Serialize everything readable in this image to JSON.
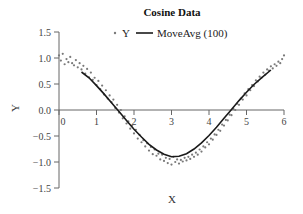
{
  "chart_data": {
    "type": "scatter",
    "title": "Cosine Data",
    "xlabel": "X",
    "ylabel": "Y",
    "xlim": [
      0,
      6
    ],
    "ylim": [
      -1.5,
      1.5
    ],
    "xticks": [
      0,
      1,
      2,
      3,
      4,
      5,
      6
    ],
    "xtick_labels": [
      "0",
      "1",
      "2",
      "3",
      "4",
      "5",
      "6"
    ],
    "yticks": [
      1.5,
      1.0,
      0.5,
      0.0,
      -0.5,
      -1.0,
      -1.5
    ],
    "ytick_labels": [
      "1.5",
      "1.0",
      "0.5",
      "0.0",
      "-0.5",
      "-1.0",
      "-1.5"
    ],
    "grid": false,
    "legend": {
      "placement": "top-center",
      "entries": [
        "Y",
        "MoveAvg (100)"
      ]
    },
    "colors": {
      "scatter": "#7a7a7a",
      "line": "#1a1a1a",
      "axis": "#666666"
    },
    "series": [
      {
        "name": "Y",
        "type": "scatter",
        "x": [
          0.0,
          0.05,
          0.1,
          0.15,
          0.2,
          0.25,
          0.3,
          0.35,
          0.4,
          0.45,
          0.5,
          0.55,
          0.6,
          0.65,
          0.7,
          0.75,
          0.8,
          0.85,
          0.9,
          0.95,
          1.0,
          1.05,
          1.1,
          1.15,
          1.2,
          1.25,
          1.3,
          1.35,
          1.4,
          1.45,
          1.5,
          1.55,
          1.6,
          1.65,
          1.7,
          1.75,
          1.8,
          1.85,
          1.9,
          1.95,
          2.0,
          2.05,
          2.1,
          2.15,
          2.2,
          2.25,
          2.3,
          2.35,
          2.4,
          2.45,
          2.5,
          2.55,
          2.6,
          2.65,
          2.7,
          2.75,
          2.8,
          2.85,
          2.9,
          2.95,
          3.0,
          3.05,
          3.1,
          3.15,
          3.2,
          3.25,
          3.3,
          3.35,
          3.4,
          3.45,
          3.5,
          3.55,
          3.6,
          3.65,
          3.7,
          3.75,
          3.8,
          3.85,
          3.9,
          3.95,
          4.0,
          4.05,
          4.1,
          4.15,
          4.2,
          4.25,
          4.3,
          4.35,
          4.4,
          4.45,
          4.5,
          4.55,
          4.6,
          4.65,
          4.7,
          4.75,
          4.8,
          4.85,
          4.9,
          4.95,
          5.0,
          5.05,
          5.1,
          5.15,
          5.2,
          5.25,
          5.3,
          5.35,
          5.4,
          5.45,
          5.5,
          5.55,
          5.6,
          5.65,
          5.7,
          5.75,
          5.8,
          5.85,
          5.9,
          5.95,
          6.0
        ],
        "y": [
          1.05,
          0.95,
          1.08,
          0.88,
          0.98,
          0.92,
          1.02,
          0.9,
          0.86,
          0.96,
          0.82,
          0.9,
          0.78,
          0.85,
          0.7,
          0.79,
          0.63,
          0.72,
          0.58,
          0.62,
          0.48,
          0.56,
          0.4,
          0.47,
          0.3,
          0.38,
          0.22,
          0.28,
          0.15,
          0.2,
          0.04,
          0.1,
          -0.05,
          0.0,
          -0.16,
          -0.12,
          -0.26,
          -0.22,
          -0.36,
          -0.3,
          -0.45,
          -0.38,
          -0.55,
          -0.48,
          -0.62,
          -0.58,
          -0.7,
          -0.64,
          -0.78,
          -0.71,
          -0.85,
          -0.76,
          -0.88,
          -0.84,
          -0.95,
          -0.86,
          -0.98,
          -0.92,
          -1.02,
          -0.94,
          -1.05,
          -0.9,
          -1.0,
          -0.95,
          -1.03,
          -0.96,
          -0.99,
          -0.92,
          -0.97,
          -0.9,
          -0.94,
          -0.86,
          -0.9,
          -0.82,
          -0.86,
          -0.76,
          -0.8,
          -0.7,
          -0.72,
          -0.62,
          -0.66,
          -0.55,
          -0.57,
          -0.47,
          -0.48,
          -0.38,
          -0.4,
          -0.28,
          -0.3,
          -0.19,
          -0.2,
          -0.09,
          -0.1,
          0.02,
          0.0,
          0.12,
          0.1,
          0.22,
          0.2,
          0.32,
          0.28,
          0.4,
          0.38,
          0.48,
          0.46,
          0.57,
          0.55,
          0.64,
          0.62,
          0.72,
          0.68,
          0.78,
          0.76,
          0.84,
          0.8,
          0.88,
          0.85,
          0.93,
          0.9,
          0.98,
          1.05
        ]
      },
      {
        "name": "MoveAvg (100)",
        "type": "line",
        "x": [
          0.6,
          0.8,
          1.0,
          1.2,
          1.4,
          1.6,
          1.8,
          2.0,
          2.2,
          2.4,
          2.6,
          2.8,
          3.0,
          3.2,
          3.4,
          3.6,
          3.8,
          4.0,
          4.2,
          4.4,
          4.6,
          4.8,
          5.0,
          5.2,
          5.4,
          5.65
        ],
        "y": [
          0.73,
          0.62,
          0.47,
          0.31,
          0.14,
          -0.03,
          -0.2,
          -0.37,
          -0.52,
          -0.66,
          -0.77,
          -0.85,
          -0.9,
          -0.89,
          -0.84,
          -0.75,
          -0.63,
          -0.49,
          -0.33,
          -0.16,
          0.01,
          0.18,
          0.34,
          0.49,
          0.62,
          0.77
        ]
      }
    ]
  }
}
